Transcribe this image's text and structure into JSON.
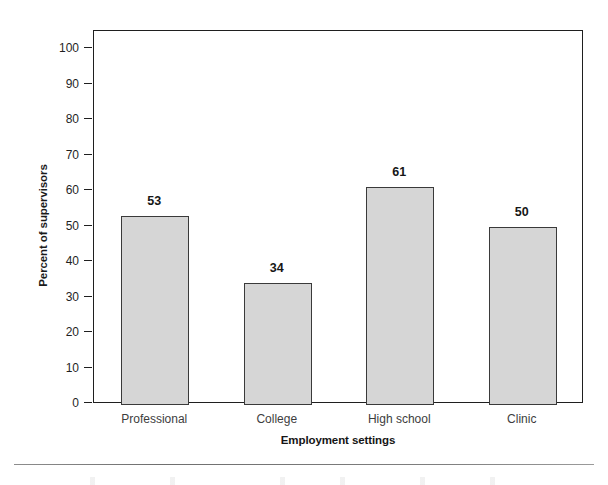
{
  "chart_data": {
    "type": "bar",
    "title": "",
    "xlabel": "Employment settings",
    "ylabel": "Percent of supervisors",
    "categories": [
      "Professional",
      "College",
      "High school",
      "Clinic"
    ],
    "values": [
      53,
      34,
      61,
      50
    ],
    "value_labels": [
      "53",
      "34",
      "61",
      "50"
    ],
    "ylim": [
      0,
      100
    ],
    "y_ticks": [
      0,
      10,
      20,
      30,
      40,
      50,
      60,
      70,
      80,
      90,
      100
    ],
    "y_tick_labels": [
      "0",
      "10",
      "20",
      "30",
      "40",
      "50",
      "60",
      "70",
      "80",
      "90",
      "100"
    ],
    "grid": false,
    "legend": false,
    "legend_position": "none",
    "bar_fill_color": "#d6d6d6",
    "bar_border_color": "#3a3a3a",
    "axis_color": "#1f1f1f",
    "background_color": "#ffffff"
  }
}
